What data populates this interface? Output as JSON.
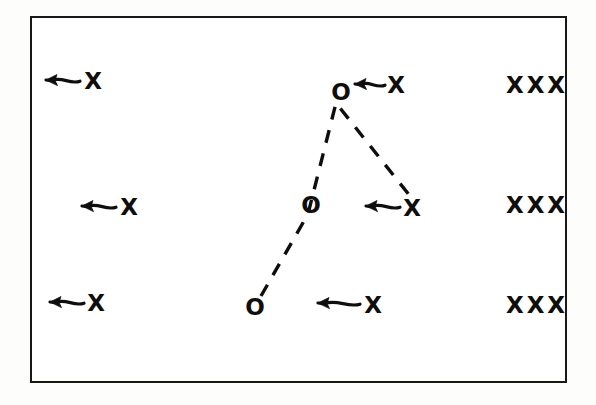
{
  "figure": {
    "background_color": "#fdfdfc",
    "ink_color": "#100e0c",
    "frame": {
      "x": 30,
      "y": 16,
      "width": 537,
      "height": 367,
      "border_color": "#1a1715",
      "border_width": 2.5
    }
  },
  "markers": [
    {
      "id": "x-left-top",
      "label": "X",
      "x": 93,
      "y": 81,
      "kind": "x"
    },
    {
      "id": "x-left-middle",
      "label": "X",
      "x": 129,
      "y": 207,
      "kind": "x"
    },
    {
      "id": "x-left-bottom",
      "label": "X",
      "x": 96,
      "y": 303,
      "kind": "x"
    },
    {
      "id": "o-top",
      "label": "O",
      "x": 341,
      "y": 92,
      "kind": "o"
    },
    {
      "id": "o-middle",
      "label": "O",
      "x": 311,
      "y": 205,
      "kind": "o"
    },
    {
      "id": "o-bottom",
      "label": "O",
      "x": 255,
      "y": 307,
      "kind": "o"
    },
    {
      "id": "x-center-top",
      "label": "X",
      "x": 396,
      "y": 85,
      "kind": "x"
    },
    {
      "id": "x-center-middle",
      "label": "X",
      "x": 412,
      "y": 208,
      "kind": "x"
    },
    {
      "id": "x-center-bottom",
      "label": "X",
      "x": 373,
      "y": 305,
      "kind": "x"
    },
    {
      "id": "xxx-top",
      "label": "XXX",
      "x": 537,
      "y": 85,
      "kind": "xxx"
    },
    {
      "id": "xxx-middle",
      "label": "XXX",
      "x": 537,
      "y": 205,
      "kind": "xxx"
    },
    {
      "id": "xxx-bottom",
      "label": "XXX",
      "x": 537,
      "y": 305,
      "kind": "xxx"
    }
  ],
  "arrows": [
    {
      "id": "arrow-left-top",
      "direction": "left",
      "tip_x": 46,
      "tail_x": 80,
      "y": 80
    },
    {
      "id": "arrow-left-middle",
      "direction": "left",
      "tip_x": 82,
      "tail_x": 116,
      "y": 206
    },
    {
      "id": "arrow-left-bottom",
      "direction": "left",
      "tip_x": 50,
      "tail_x": 84,
      "y": 302
    },
    {
      "id": "arrow-center-top",
      "direction": "left",
      "tip_x": 355,
      "tail_x": 385,
      "y": 84
    },
    {
      "id": "arrow-center-middle",
      "direction": "left",
      "tip_x": 366,
      "tail_x": 400,
      "y": 206
    },
    {
      "id": "arrow-center-bottom",
      "direction": "left",
      "tip_x": 318,
      "tail_x": 360,
      "y": 303
    }
  ],
  "dashed_path": {
    "id": "motion-path",
    "style": "dashed",
    "stroke_width": 3.4,
    "points": [
      {
        "x": 261,
        "y": 296
      },
      {
        "x": 308,
        "y": 214
      },
      {
        "x": 336,
        "y": 103
      },
      {
        "x": 410,
        "y": 196
      }
    ]
  }
}
